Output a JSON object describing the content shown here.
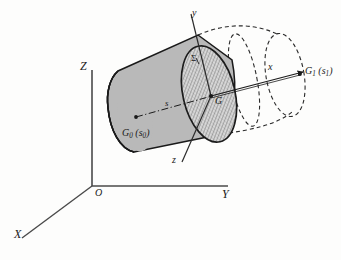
{
  "figure": {
    "background_color": "#fdfdfc",
    "line_color": "#1a1a1a",
    "body_fill_color": "#b8b8b8",
    "hatch_fill_color": "#c9c9c9",
    "dashed_fill_color": "#ffffff"
  },
  "global_axes": {
    "origin_label": "O",
    "x_label": "X",
    "y_label": "Y",
    "z_label": "Z"
  },
  "local_axes": {
    "x_label": "x",
    "y_label": "y",
    "z_label": "z"
  },
  "points": {
    "centroid_label": "G",
    "left_centroid_label": "G",
    "left_centroid_sub": "0",
    "left_centroid_param": "s",
    "left_centroid_param_sub": "0",
    "right_centroid_label": "G",
    "right_centroid_sub": "1",
    "right_centroid_param": "s",
    "right_centroid_param_sub": "1"
  },
  "annotations": {
    "section_label": "Σ",
    "arc_length_label": "s",
    "paren_open": "(",
    "paren_close": ")"
  }
}
